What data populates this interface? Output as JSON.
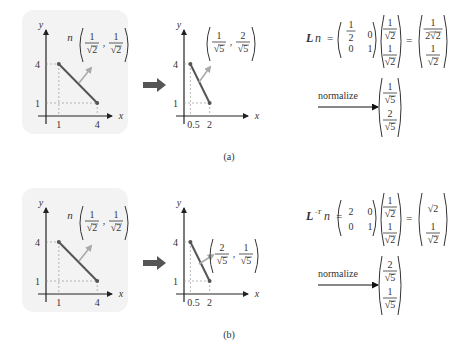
{
  "figure": {
    "panels": [
      {
        "id": "a",
        "caption": "(a)",
        "before_plot": {
          "x_axis_label": "x",
          "y_axis_label": "y",
          "x_ticks": [
            "1",
            "4"
          ],
          "y_ticks": [
            "4",
            "1"
          ],
          "segment": [
            [
              1,
              4
            ],
            [
              4,
              1
            ]
          ],
          "normal_label": {
            "prefix": "n",
            "num1": "1",
            "den1": "√2",
            "num2": "1",
            "den2": "√2"
          }
        },
        "after_plot": {
          "x_axis_label": "x",
          "y_axis_label": "y",
          "x_ticks": [
            "0.5",
            "2"
          ],
          "y_ticks": [
            "4",
            "1"
          ],
          "segment": [
            [
              0.5,
              4
            ],
            [
              2,
              1
            ]
          ],
          "normal_label": {
            "num1": "1",
            "den1": "√5",
            "num2": "2",
            "den2": "√5"
          }
        },
        "equation": {
          "lhs_matrix_symbol": "L",
          "lhs_superscript": "",
          "lhs_vector_symbol": "n",
          "matrix": [
            [
              "1/2",
              "0"
            ],
            [
              "0",
              "1"
            ]
          ],
          "vector": [
            [
              "1",
              "√2"
            ],
            [
              "1",
              "√2"
            ]
          ],
          "result": [
            [
              "1",
              "2√2"
            ],
            [
              "1",
              "√2"
            ]
          ],
          "normalize_label": "normalize",
          "normalized": [
            [
              "1",
              "√5"
            ],
            [
              "2",
              "√5"
            ]
          ]
        }
      },
      {
        "id": "b",
        "caption": "(b)",
        "before_plot": {
          "x_axis_label": "x",
          "y_axis_label": "y",
          "x_ticks": [
            "1",
            "4"
          ],
          "y_ticks": [
            "4",
            "1"
          ],
          "segment": [
            [
              1,
              4
            ],
            [
              4,
              1
            ]
          ],
          "normal_label": {
            "prefix": "n",
            "num1": "1",
            "den1": "√2",
            "num2": "1",
            "den2": "√2"
          }
        },
        "after_plot": {
          "x_axis_label": "x",
          "y_axis_label": "y",
          "x_ticks": [
            "0.5",
            "2"
          ],
          "y_ticks": [
            "4",
            "1"
          ],
          "segment": [
            [
              0.5,
              4
            ],
            [
              2,
              1
            ]
          ],
          "normal_label": {
            "num1": "2",
            "den1": "√5",
            "num2": "1",
            "den2": "√5"
          }
        },
        "equation": {
          "lhs_matrix_symbol": "L",
          "lhs_superscript": "-T",
          "lhs_vector_symbol": "n",
          "matrix": [
            [
              "2",
              "0"
            ],
            [
              "0",
              "1"
            ]
          ],
          "vector": [
            [
              "1",
              "√2"
            ],
            [
              "1",
              "√2"
            ]
          ],
          "result": [
            [
              "√2",
              ""
            ],
            [
              "1",
              "√2"
            ]
          ],
          "normalize_label": "normalize",
          "normalized": [
            [
              "2",
              "√5"
            ],
            [
              "1",
              "√5"
            ]
          ]
        }
      }
    ],
    "colors": {
      "panel_bg": "#f3f3f3",
      "segment": "#555555",
      "normal_arrow": "#aaaaaa",
      "transform_arrow": "#555555",
      "dashed": "#999999",
      "text": "#333333"
    }
  }
}
